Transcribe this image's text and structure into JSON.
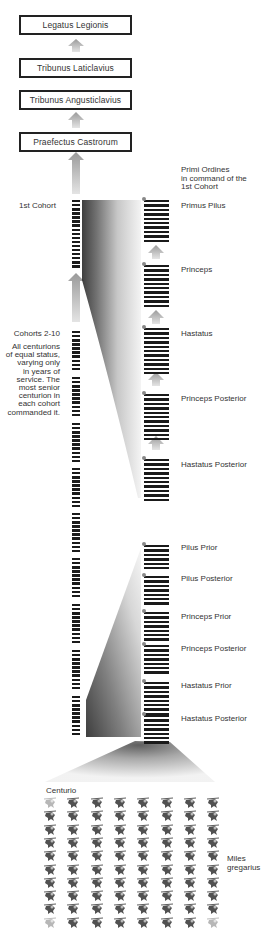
{
  "command_chain": [
    {
      "label": "Legatus Legionis"
    },
    {
      "label": "Tribunus Laticlavius"
    },
    {
      "label": "Tribunus Angusticlavius"
    },
    {
      "label": "Praefectus Castrorum"
    }
  ],
  "first_cohort": {
    "label": "1st Cohort",
    "primi_ordines_note": [
      "Primi Ordines",
      "in command of the",
      "1st Cohort"
    ],
    "ranks": [
      {
        "label": "Primus Pilus"
      },
      {
        "label": "Princeps"
      },
      {
        "label": "Hastatus"
      },
      {
        "label": "Princeps Posterior"
      },
      {
        "label": "Hastatus Posterior"
      }
    ]
  },
  "other_cohorts": {
    "label": "Cohorts 2-10",
    "description": [
      "All centurions",
      "of equal status,",
      "varying only",
      "in years of",
      "service. The",
      "most senior",
      "centurion in",
      "each cohort",
      "commanded it."
    ],
    "ranks": [
      {
        "label": "Pilus Prior"
      },
      {
        "label": "Pilus Posterior"
      },
      {
        "label": "Princeps Prior"
      },
      {
        "label": "Princeps Posterior"
      },
      {
        "label": "Hastatus Prior"
      },
      {
        "label": "Hastatus Posterior"
      }
    ]
  },
  "century": {
    "centurio_label": "Centurio",
    "soldiers_label": [
      "Miles",
      "gregarius"
    ],
    "grid": {
      "columns": 8,
      "rows": 10
    }
  },
  "colors": {
    "bar": "#1a1a1a",
    "arrow": "#b8b8b8",
    "box_border": "#222222",
    "dot": "#888888"
  }
}
